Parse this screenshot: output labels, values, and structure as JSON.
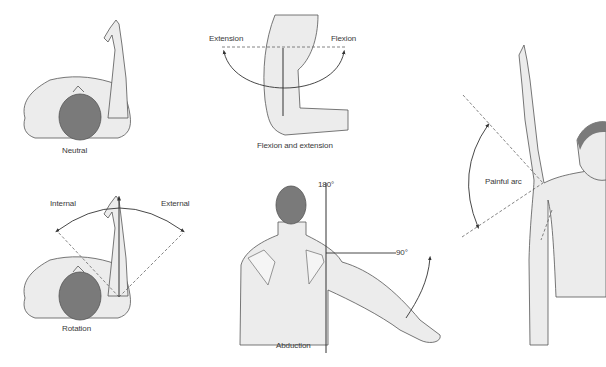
{
  "colors": {
    "skin": "#ececec",
    "outline": "#555555",
    "hair": "#7a7a7a",
    "line": "#333333",
    "dashed": "#666666"
  },
  "panels": {
    "neutral": {
      "caption": "Neutral"
    },
    "flexion_extension": {
      "caption": "Flexion and extension",
      "left_label": "Extension",
      "right_label": "Flexion"
    },
    "rotation": {
      "caption": "Rotation",
      "left_label": "Internal",
      "right_label": "External"
    },
    "abduction": {
      "caption": "Abduction",
      "top_label": "180°",
      "side_label": "90°"
    },
    "painful_arc": {
      "caption": "Painful arc"
    }
  }
}
